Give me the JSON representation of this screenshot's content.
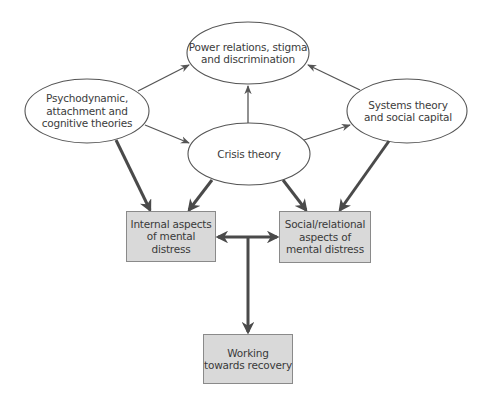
{
  "diagram": {
    "colors": {
      "line": "#555555",
      "ellipse_stroke": "#555555",
      "box_fill": "#d9d9d9",
      "box_stroke": "#8a8a8a",
      "text": "#3c3c3c"
    },
    "ellipses": {
      "power": {
        "label": "Power relations, stigma and discrimination",
        "line1": "Power relations, stigma",
        "line2": "and discrimination"
      },
      "psychodynamic": {
        "label": "Psychodynamic, attachment and cognitive theories",
        "line1": "Psychodynamic,",
        "line2": "attachment and",
        "line3": "cognitive theories"
      },
      "systems": {
        "label": "Systems theory and social capital",
        "line1": "Systems theory",
        "line2": "and social capital"
      },
      "crisis": {
        "label": "Crisis theory",
        "line1": "Crisis theory"
      }
    },
    "boxes": {
      "internal": {
        "label": "Internal aspects of mental distress",
        "line1": "Internal aspects",
        "line2": "of mental distress"
      },
      "social": {
        "label": "Social/relational aspects of mental distress",
        "line1": "Social/relational",
        "line2": "aspects of",
        "line3": "mental distress"
      },
      "recovery": {
        "label": "Working towards recovery",
        "line1": "Working",
        "line2": "towards recovery"
      }
    },
    "edges": [
      {
        "from": "psychodynamic",
        "to": "power",
        "style": "thin"
      },
      {
        "from": "systems",
        "to": "power",
        "style": "thin"
      },
      {
        "from": "crisis",
        "to": "power",
        "style": "thin"
      },
      {
        "from": "psychodynamic",
        "to": "crisis",
        "style": "thin"
      },
      {
        "from": "crisis",
        "to": "systems",
        "style": "thin"
      },
      {
        "from": "psychodynamic",
        "to": "internal",
        "style": "thick"
      },
      {
        "from": "crisis",
        "to": "internal",
        "style": "thick"
      },
      {
        "from": "crisis",
        "to": "social",
        "style": "thick"
      },
      {
        "from": "systems",
        "to": "social",
        "style": "thick"
      },
      {
        "from": "internal",
        "to": "social",
        "style": "thick-bidirectional"
      },
      {
        "from": "internal-social-link",
        "to": "recovery",
        "style": "thick"
      }
    ]
  }
}
